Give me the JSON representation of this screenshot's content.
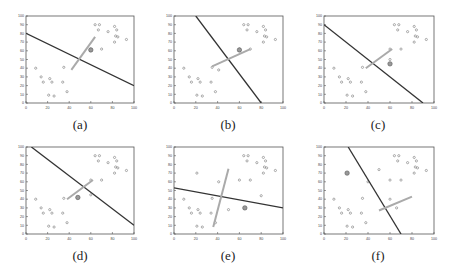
{
  "chart_data": {
    "type": "scatter",
    "title": "",
    "xlabel": "",
    "ylabel": "",
    "xlim": [
      0,
      100
    ],
    "ylim": [
      0,
      100
    ],
    "x_ticks": [
      0,
      20,
      40,
      60,
      80,
      100
    ],
    "y_ticks": [
      0,
      10,
      20,
      30,
      40,
      50,
      60,
      70,
      80,
      90,
      100
    ],
    "grid": false,
    "points": [
      [
        9,
        40
      ],
      [
        14,
        30
      ],
      [
        16,
        24
      ],
      [
        22,
        28
      ],
      [
        24,
        24
      ],
      [
        21,
        9
      ],
      [
        26,
        8
      ],
      [
        34,
        24
      ],
      [
        35,
        41
      ],
      [
        38,
        13
      ],
      [
        64,
        90
      ],
      [
        68,
        90
      ],
      [
        67,
        84
      ],
      [
        76,
        82
      ],
      [
        82,
        88
      ],
      [
        84,
        84
      ],
      [
        83,
        77
      ],
      [
        85,
        76
      ],
      [
        82,
        70
      ],
      [
        93,
        73
      ],
      [
        70,
        62
      ],
      [
        60,
        62
      ]
    ],
    "panels": [
      {
        "label": "(a)",
        "line": [
          [
            0,
            80
          ],
          [
            100,
            20
          ]
        ],
        "segment": [
          [
            42,
            38
          ],
          [
            64,
            76
          ]
        ],
        "highlight": [
          [
            60,
            61
          ]
        ],
        "extra": []
      },
      {
        "label": "(b)",
        "line": [
          [
            20,
            100
          ],
          [
            80,
            0
          ]
        ],
        "segment": [
          [
            35,
            42
          ],
          [
            70,
            62
          ]
        ],
        "highlight": [
          [
            60,
            61
          ]
        ],
        "extra": [
          [
            41,
            38
          ]
        ]
      },
      {
        "label": "(c)",
        "line": [
          [
            0,
            90
          ],
          [
            90,
            0
          ]
        ],
        "segment": [
          [
            38,
            40
          ],
          [
            62,
            62
          ]
        ],
        "highlight": [
          [
            60,
            45
          ]
        ],
        "extra": [
          [
            60,
            50
          ]
        ]
      },
      {
        "label": "(d)",
        "line": [
          [
            5,
            100
          ],
          [
            100,
            10
          ]
        ],
        "segment": [
          [
            38,
            40
          ],
          [
            62,
            62
          ]
        ],
        "highlight": [
          [
            48,
            42
          ]
        ],
        "extra": [
          [
            60,
            45
          ]
        ]
      },
      {
        "label": "(e)",
        "line": [
          [
            0,
            53
          ],
          [
            100,
            30
          ]
        ],
        "segment": [
          [
            36,
            8
          ],
          [
            50,
            75
          ]
        ],
        "highlight": [
          [
            65,
            30
          ]
        ],
        "extra": [
          [
            21,
            70
          ],
          [
            41,
            60
          ],
          [
            50,
            28
          ],
          [
            80,
            44
          ]
        ]
      },
      {
        "label": "(f)",
        "line": [
          [
            22,
            100
          ],
          [
            70,
            0
          ]
        ],
        "segment": [
          [
            50,
            27
          ],
          [
            80,
            43
          ]
        ],
        "highlight": [
          [
            21,
            70
          ]
        ],
        "extra": [
          [
            50,
            74
          ],
          [
            40,
            60
          ],
          [
            60,
            40
          ],
          [
            66,
            30
          ]
        ]
      }
    ]
  },
  "captions": {
    "a": "(a)",
    "b": "(b)",
    "c": "(c)",
    "d": "(d)",
    "e": "(e)",
    "f": "(f)"
  }
}
